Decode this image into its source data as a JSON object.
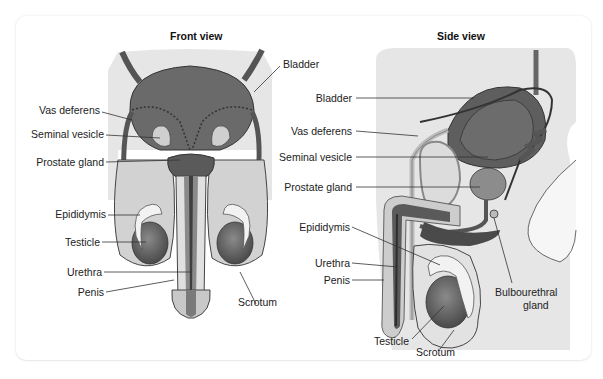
{
  "figure": {
    "panels": [
      {
        "title": "Front view",
        "labels": [
          {
            "text": "Bladder"
          },
          {
            "text": "Vas deferens"
          },
          {
            "text": "Seminal vesicle"
          },
          {
            "text": "Prostate gland"
          },
          {
            "text": "Epididymis"
          },
          {
            "text": "Testicle"
          },
          {
            "text": "Urethra"
          },
          {
            "text": "Penis"
          },
          {
            "text": "Scrotum"
          }
        ]
      },
      {
        "title": "Side view",
        "labels": [
          {
            "text": "Bladder"
          },
          {
            "text": "Vas deferens"
          },
          {
            "text": "Seminal vesicle"
          },
          {
            "text": "Prostate gland"
          },
          {
            "text": "Epididymis"
          },
          {
            "text": "Urethra"
          },
          {
            "text": "Penis"
          },
          {
            "text": "Bulbourethral"
          },
          {
            "text": "gland"
          },
          {
            "text": "Testicle"
          },
          {
            "text": "Scrotum"
          }
        ]
      }
    ],
    "colors": {
      "background": "#ffffff",
      "tissue_light": "#e4e4e4",
      "tissue_mid": "#bdbdbd",
      "organ_dark": "#6e6e6e",
      "organ_darker": "#4e4e4e",
      "outline": "#3a3a3a",
      "leader_line": "#333333"
    }
  }
}
